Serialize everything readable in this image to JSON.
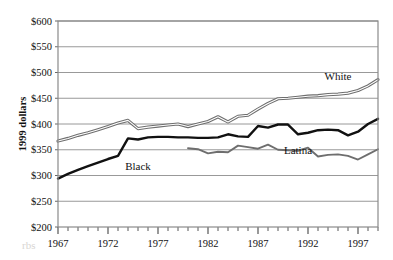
{
  "chart_data": {
    "type": "line",
    "title": "",
    "xlabel": "",
    "ylabel": "1999 dollars",
    "xlim": [
      1967,
      1999
    ],
    "ylim": [
      200,
      600
    ],
    "ytick_step": 50,
    "grid": true,
    "legend_position": "inline-annotations",
    "x_tick_labels": [
      "1967",
      "1972",
      "1977",
      "1982",
      "1987",
      "1992",
      "1997"
    ],
    "x_tick_values": [
      1967,
      1972,
      1977,
      1982,
      1987,
      1992,
      1997
    ],
    "x_minor_tick_step": 1,
    "y_tick_labels": [
      "$600",
      "$550",
      "$500",
      "$450",
      "$400",
      "$350",
      "$300",
      "$250",
      "$200"
    ],
    "y_tick_values": [
      600,
      550,
      500,
      450,
      400,
      350,
      300,
      250,
      200
    ],
    "series": [
      {
        "name": "White",
        "label": "White",
        "color": "#6e6e6e",
        "style": "double-line",
        "x": [
          1967,
          1968,
          1969,
          1970,
          1971,
          1972,
          1973,
          1974,
          1975,
          1976,
          1977,
          1978,
          1979,
          1980,
          1981,
          1982,
          1983,
          1984,
          1985,
          1986,
          1987,
          1988,
          1989,
          1990,
          1991,
          1992,
          1993,
          1994,
          1995,
          1996,
          1997,
          1998,
          1999
        ],
        "values": [
          367,
          372,
          378,
          383,
          389,
          395,
          402,
          407,
          391,
          394,
          396,
          398,
          400,
          395,
          400,
          405,
          414,
          404,
          415,
          417,
          429,
          440,
          449,
          450,
          452,
          454,
          455,
          457,
          458,
          460,
          465,
          474,
          486
        ]
      },
      {
        "name": "Black",
        "label": "Black",
        "color": "#111111",
        "style": "thick-line",
        "x": [
          1967,
          1968,
          1969,
          1970,
          1971,
          1972,
          1973,
          1974,
          1975,
          1976,
          1977,
          1978,
          1979,
          1980,
          1981,
          1982,
          1983,
          1984,
          1985,
          1986,
          1987,
          1988,
          1989,
          1990,
          1991,
          1992,
          1993,
          1994,
          1995,
          1996,
          1997,
          1998,
          1999
        ],
        "values": [
          294,
          303,
          311,
          318,
          325,
          332,
          338,
          372,
          370,
          374,
          375,
          375,
          374,
          374,
          373,
          373,
          374,
          380,
          376,
          375,
          396,
          393,
          399,
          399,
          380,
          383,
          388,
          389,
          388,
          378,
          385,
          400,
          410
        ]
      },
      {
        "name": "Latina",
        "label": "Latina",
        "color": "#6e6e6e",
        "style": "medium-line",
        "x": [
          1980,
          1981,
          1982,
          1983,
          1984,
          1985,
          1986,
          1987,
          1988,
          1989,
          1990,
          1991,
          1992,
          1993,
          1994,
          1995,
          1996,
          1997,
          1998,
          1999
        ],
        "values": [
          353,
          351,
          343,
          346,
          345,
          358,
          355,
          352,
          360,
          350,
          349,
          348,
          354,
          337,
          340,
          341,
          338,
          331,
          341,
          351
        ]
      }
    ],
    "annotations": [
      {
        "text": "White",
        "x": 1995,
        "y": 485
      },
      {
        "text": "Black",
        "x": 1975,
        "y": 310
      },
      {
        "text": "Latina",
        "x": 1991,
        "y": 341
      }
    ]
  },
  "watermark": {
    "text": "rbs"
  }
}
